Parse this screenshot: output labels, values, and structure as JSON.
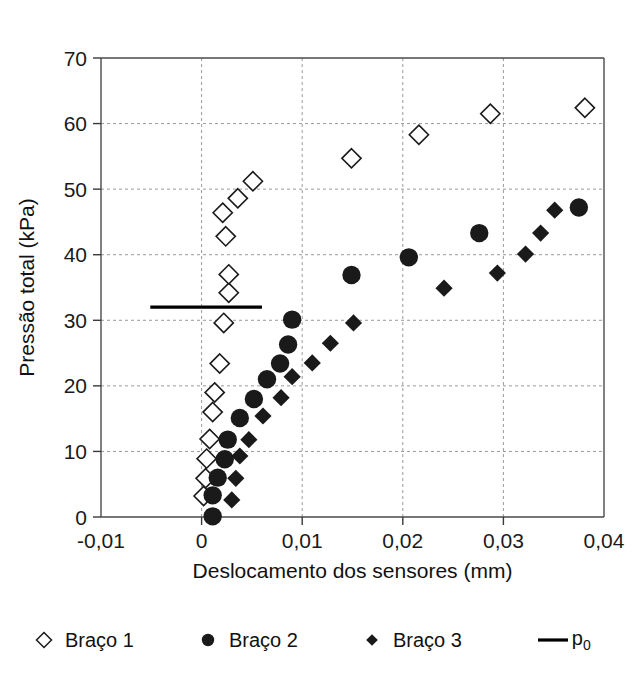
{
  "chart_data": {
    "type": "scatter",
    "title": "",
    "xlabel": "Deslocamento dos sensores (mm)",
    "ylabel": "Pressão total (kPa)",
    "xlim": [
      -0.01,
      0.04
    ],
    "ylim": [
      0,
      70
    ],
    "xticks": [
      -0.01,
      0,
      0.01,
      0.02,
      0.03,
      0.04
    ],
    "xticklabels": [
      "-0,01",
      "0",
      "0,01",
      "0,02",
      "0,03",
      "0,04"
    ],
    "yticks": [
      0,
      10,
      20,
      30,
      40,
      50,
      60,
      70
    ],
    "yticklabels": [
      "0",
      "10",
      "20",
      "30",
      "40",
      "50",
      "60",
      "70"
    ],
    "grid": true,
    "legend_position": "below",
    "series": [
      {
        "name": "Braço 1",
        "marker": "open-diamond",
        "color": "#1a1a1a",
        "points": [
          [
            0.0002,
            3.2
          ],
          [
            0.0004,
            5.9
          ],
          [
            0.0005,
            8.9
          ],
          [
            0.0008,
            11.9
          ],
          [
            0.0011,
            16.0
          ],
          [
            0.0013,
            19.0
          ],
          [
            0.0018,
            23.4
          ],
          [
            0.0022,
            29.6
          ],
          [
            0.0027,
            34.2
          ],
          [
            0.0027,
            37.0
          ],
          [
            0.0024,
            42.8
          ],
          [
            0.0021,
            46.4
          ],
          [
            0.0036,
            48.6
          ],
          [
            0.0051,
            51.2
          ],
          [
            0.0149,
            54.7
          ],
          [
            0.0216,
            58.3
          ],
          [
            0.0287,
            61.5
          ],
          [
            0.0381,
            62.4
          ]
        ]
      },
      {
        "name": "Braço 2",
        "marker": "filled-circle",
        "color": "#1a1a1a",
        "points": [
          [
            0.0011,
            0.1
          ],
          [
            0.0011,
            3.3
          ],
          [
            0.0016,
            6.0
          ],
          [
            0.0023,
            8.8
          ],
          [
            0.0026,
            11.8
          ],
          [
            0.0038,
            15.1
          ],
          [
            0.0052,
            18.0
          ],
          [
            0.0065,
            21.0
          ],
          [
            0.0078,
            23.4
          ],
          [
            0.0086,
            26.3
          ],
          [
            0.009,
            30.1
          ],
          [
            0.0149,
            36.9
          ],
          [
            0.0206,
            39.6
          ],
          [
            0.0276,
            43.3
          ],
          [
            0.0375,
            47.2
          ]
        ]
      },
      {
        "name": "Braço 3",
        "marker": "filled-diamond",
        "color": "#1a1a1a",
        "points": [
          [
            0.003,
            2.6
          ],
          [
            0.0034,
            5.9
          ],
          [
            0.0038,
            9.3
          ],
          [
            0.0047,
            11.8
          ],
          [
            0.0061,
            15.4
          ],
          [
            0.0079,
            18.2
          ],
          [
            0.009,
            21.4
          ],
          [
            0.011,
            23.5
          ],
          [
            0.0128,
            26.5
          ],
          [
            0.0151,
            29.6
          ],
          [
            0.0241,
            34.9
          ],
          [
            0.0294,
            37.2
          ],
          [
            0.0322,
            40.1
          ],
          [
            0.0337,
            43.3
          ],
          [
            0.0351,
            46.8
          ]
        ]
      }
    ],
    "reference_line": {
      "name": "p0",
      "label": "p",
      "subscript": "0",
      "value": 32.0,
      "x_start": -0.0051,
      "x_end": 0.006,
      "color": "#000000"
    }
  },
  "legend": {
    "items": [
      {
        "id": "braco-1",
        "label": "Braço 1",
        "glyph": "open-diamond-icon"
      },
      {
        "id": "braco-2",
        "label": "Braço 2",
        "glyph": "filled-circle-icon"
      },
      {
        "id": "braco-3",
        "label": "Braço 3",
        "glyph": "filled-diamond-icon"
      },
      {
        "id": "p0",
        "label": "p",
        "glyph": "line-icon",
        "subscript": "0"
      }
    ]
  }
}
